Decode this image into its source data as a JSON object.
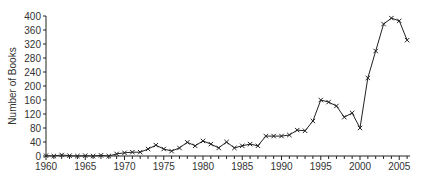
{
  "chart_data": {
    "type": "line",
    "title": "",
    "xlabel": "",
    "ylabel": "Number of Books",
    "xlim": [
      1960,
      2006
    ],
    "ylim": [
      0,
      400
    ],
    "grid": false,
    "legend": null,
    "marker": "x",
    "line_color": "#222222",
    "x_ticks": [
      1960,
      1965,
      1970,
      1975,
      1980,
      1985,
      1990,
      1995,
      2000,
      2005
    ],
    "y_ticks": [
      0,
      40,
      80,
      120,
      160,
      200,
      240,
      280,
      320,
      360,
      400
    ],
    "x": [
      1960,
      1961,
      1962,
      1963,
      1964,
      1965,
      1966,
      1967,
      1968,
      1969,
      1970,
      1971,
      1972,
      1973,
      1974,
      1975,
      1976,
      1977,
      1978,
      1979,
      1980,
      1981,
      1982,
      1983,
      1984,
      1985,
      1986,
      1987,
      1988,
      1989,
      1990,
      1991,
      1992,
      1993,
      1994,
      1995,
      1996,
      1997,
      1998,
      1999,
      2000,
      2001,
      2002,
      2003,
      2004,
      2005,
      2006
    ],
    "series": [
      {
        "name": "Number of Books",
        "values": [
          1,
          0,
          3,
          1,
          0,
          1,
          0,
          2,
          0,
          6,
          9,
          11,
          11,
          20,
          31,
          20,
          14,
          23,
          39,
          29,
          43,
          34,
          23,
          40,
          23,
          29,
          34,
          29,
          57,
          57,
          57,
          60,
          74,
          72,
          100,
          160,
          154,
          143,
          111,
          123,
          80,
          223,
          300,
          377,
          394,
          386,
          331
        ]
      }
    ]
  }
}
